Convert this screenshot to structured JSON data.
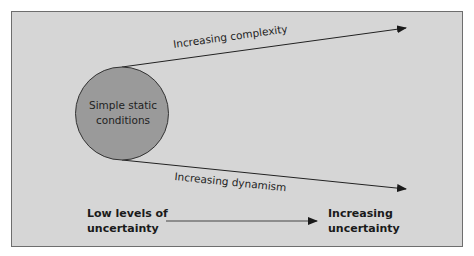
{
  "diagram": {
    "circle": {
      "label_line1": "Simple static",
      "label_line2": "conditions",
      "fill": "#9a9a9a",
      "stroke": "#333333"
    },
    "arrows": [
      {
        "label": "Increasing complexity"
      },
      {
        "label": "Increasing dynamism"
      }
    ],
    "scale": {
      "low_line1": "Low levels of",
      "low_line2": "uncertainty",
      "high_line1": "Increasing",
      "high_line2": "uncertainty"
    },
    "colors": {
      "panel_background": "#d6d6d6",
      "panel_border": "#6e6e6e",
      "line": "#222222"
    }
  }
}
